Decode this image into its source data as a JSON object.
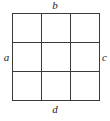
{
  "figure": {
    "type": "grid-diagram",
    "grid": {
      "rows": 3,
      "columns": 3,
      "cell_count": 9,
      "line_color": "#3a3a3a",
      "line_width_px": 1,
      "background_color": "#ffffff"
    },
    "labels": {
      "top": "b",
      "left": "a",
      "right": "c",
      "bottom": "d"
    }
  }
}
